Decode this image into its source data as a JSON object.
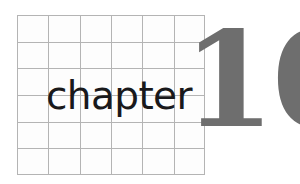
{
  "page": {
    "kind": "book-chapter-opener",
    "background_color": "#ffffff",
    "width": 300,
    "height": 184
  },
  "heading": {
    "label": "chapter",
    "number": "10",
    "label_color": "#19191b",
    "number_color": "#6e6e6e"
  },
  "grid": {
    "name": "grid-artwork",
    "columns": 6,
    "rows": 6,
    "line_color": "#b4b4b4",
    "fill_color": "#fdfdfd",
    "x": 17,
    "y": 15,
    "width": 188,
    "height": 160,
    "column_positions": [
      0,
      31.33,
      62.67,
      94,
      125.33,
      156.67,
      188
    ],
    "row_positions": [
      0,
      26.67,
      53.33,
      80,
      106.67,
      133.33,
      160
    ]
  }
}
